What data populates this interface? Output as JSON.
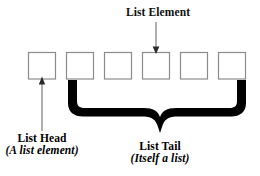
{
  "diagram": {
    "background_color": "#ffffff",
    "box_border_color": "#8c8c8c",
    "box_fill_color": "#ffffff",
    "brace_color": "#000000",
    "arrow_color": "#6e6e6e",
    "text_color": "#101010",
    "boxes": [
      {
        "id": "box-1",
        "x": 28,
        "y": 52,
        "w": 28,
        "h": 27,
        "role": "list-head"
      },
      {
        "id": "box-2",
        "x": 66,
        "y": 52,
        "w": 28,
        "h": 27,
        "role": "tail-element"
      },
      {
        "id": "box-3",
        "x": 104,
        "y": 52,
        "w": 28,
        "h": 27,
        "role": "tail-element"
      },
      {
        "id": "box-4",
        "x": 142,
        "y": 52,
        "w": 28,
        "h": 27,
        "role": "annotated-element"
      },
      {
        "id": "box-5",
        "x": 180,
        "y": 52,
        "w": 28,
        "h": 27,
        "role": "tail-element"
      },
      {
        "id": "box-6",
        "x": 218,
        "y": 52,
        "w": 28,
        "h": 27,
        "role": "tail-element"
      }
    ],
    "labels": {
      "list_element": "List Element",
      "list_head_title": "List Head",
      "list_head_subtitle": "(A list element)",
      "list_tail_title": "List Tail",
      "list_tail_subtitle": "(Itself a list)"
    },
    "connectors": [
      {
        "id": "list-element-arrow",
        "from": "label-list-element",
        "to": "box-4",
        "direction": "down",
        "x": 156,
        "y_start": 22,
        "y_end": 52
      },
      {
        "id": "list-head-arrow",
        "from": "label-list-head",
        "to": "box-1",
        "direction": "up",
        "x": 42,
        "y_start": 130,
        "y_end": 79
      }
    ],
    "brace": {
      "id": "list-tail-brace",
      "covers_boxes": [
        "box-2",
        "box-3",
        "box-4",
        "box-5",
        "box-6"
      ],
      "left_x": 68,
      "right_x": 246,
      "top_y": 80,
      "center_x": 160,
      "point_y": 129,
      "thickness": 9
    }
  }
}
